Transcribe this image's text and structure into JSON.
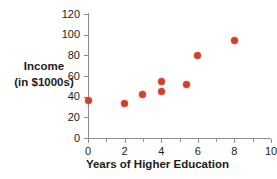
{
  "chart_data": {
    "type": "scatter",
    "title": "",
    "xlabel": "Years of Higher Education",
    "ylabel": "Income\n(in $1000s)",
    "ylabel_lines": [
      "Income",
      "(in $1000s)"
    ],
    "xlim": [
      0,
      10
    ],
    "ylim": [
      0,
      120
    ],
    "xticks": [
      0,
      2,
      4,
      6,
      8,
      10
    ],
    "xtick_labels": [
      "0",
      "2",
      "4",
      "6",
      "8",
      "10"
    ],
    "x_minor_ticks": [
      1,
      3,
      5,
      7,
      9
    ],
    "yticks": [
      0,
      20,
      40,
      60,
      80,
      100,
      120
    ],
    "ytick_labels": [
      "0",
      "20",
      "40",
      "60",
      "80",
      "100",
      "120"
    ],
    "grid": false,
    "legend": null,
    "marker_color": "#d4402b",
    "axis_color": "#8c8c8c",
    "points": [
      {
        "x": 0,
        "y": 36
      },
      {
        "x": 2,
        "y": 33
      },
      {
        "x": 3,
        "y": 42
      },
      {
        "x": 4,
        "y": 55
      },
      {
        "x": 4,
        "y": 45
      },
      {
        "x": 5.4,
        "y": 52
      },
      {
        "x": 6,
        "y": 80
      },
      {
        "x": 8,
        "y": 94
      }
    ]
  }
}
